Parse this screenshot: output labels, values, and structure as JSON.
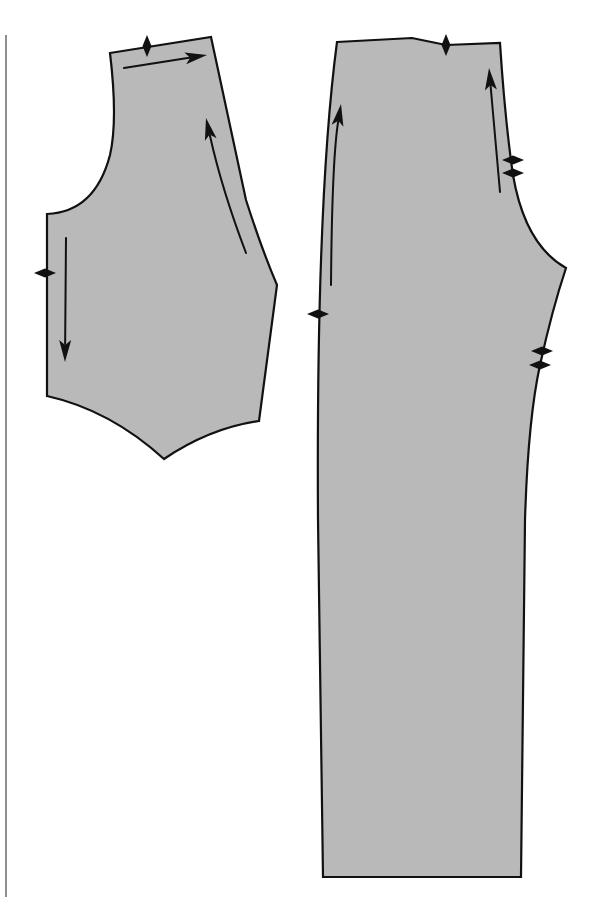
{
  "diagram": {
    "type": "sewing-pattern-pieces",
    "canvas": {
      "width": 602,
      "height": 897,
      "background": "#ffffff"
    },
    "colors": {
      "fill": "#b9b9b9",
      "outline": "#111111",
      "margin_rule": "#8f8f8f"
    },
    "margin_rule": {
      "x": 6,
      "y1": 35,
      "y2": 897
    },
    "pieces": [
      {
        "id": "bodice-piece",
        "label": "",
        "path": "M110,53 L211,37 L246,200 Q262,250 277,285 L259,421 Q210,428 164,459 Q110,410 47,396 L47,214 Q95,212 110,155 Q118,120 110,53 Z",
        "grainlines": [
          {
            "name": "grainline-top",
            "x1": 124,
            "y1": 68,
            "x2": 207,
            "y2": 55,
            "ctrl": null
          },
          {
            "name": "grainline-side",
            "x1": 246,
            "y1": 253,
            "x2": 206,
            "y2": 118,
            "ctrl": [
              222,
              190
            ]
          },
          {
            "name": "grainline-left",
            "x1": 66,
            "y1": 238,
            "x2": 65,
            "y2": 362,
            "ctrl": null
          }
        ],
        "notches": [
          {
            "name": "notch-shoulder",
            "x": 147,
            "y": 46,
            "orient": "vertical"
          },
          {
            "name": "notch-side",
            "x": 45,
            "y": 273,
            "orient": "horizontal"
          }
        ]
      },
      {
        "id": "trouser-piece",
        "label": "",
        "path": "M337,42 L412,38 L446,45 L500,43 Q505,120 513,175 Q525,245 566,268 Q552,310 540,365 Q528,420 525,520 L521,877 L323,877 L318,520 Q316,200 337,42 Z",
        "grainlines": [
          {
            "name": "grainline-left",
            "x1": 331,
            "y1": 285,
            "x2": 341,
            "y2": 104,
            "ctrl": [
              332,
              160
            ]
          },
          {
            "name": "grainline-right",
            "x1": 500,
            "y1": 192,
            "x2": 489,
            "y2": 68,
            "ctrl": null
          }
        ],
        "notches": [
          {
            "name": "notch-waist",
            "x": 446,
            "y": 45,
            "orient": "vertical"
          },
          {
            "name": "notch-side",
            "x": 318,
            "y": 314,
            "orient": "horizontal"
          },
          {
            "name": "notch-hip-1",
            "x": 513,
            "y": 160,
            "orient": "horizontal"
          },
          {
            "name": "notch-hip-2",
            "x": 513,
            "y": 173,
            "orient": "horizontal"
          },
          {
            "name": "notch-inseam-1",
            "x": 542,
            "y": 351,
            "orient": "horizontal"
          },
          {
            "name": "notch-inseam-2",
            "x": 540,
            "y": 365,
            "orient": "horizontal"
          }
        ]
      }
    ]
  }
}
